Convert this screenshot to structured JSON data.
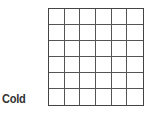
{
  "label": "Cold",
  "grid": {
    "rows": 6,
    "cols": 6,
    "line_color": "#555555"
  }
}
